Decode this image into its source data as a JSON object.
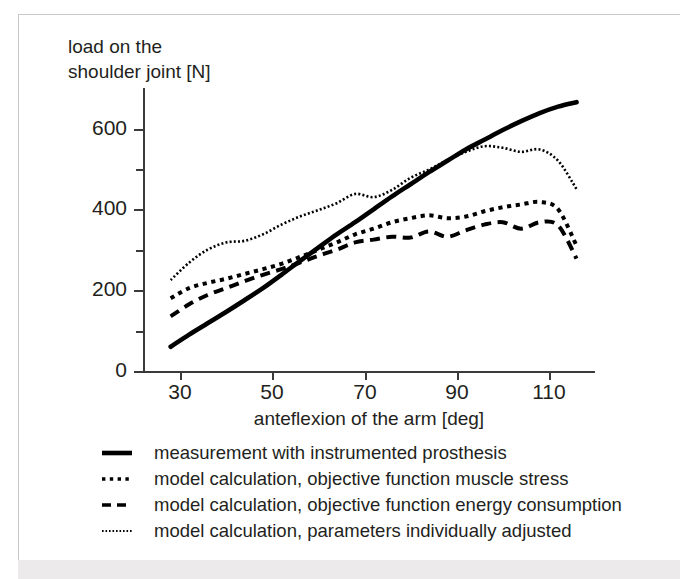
{
  "figure": {
    "y_axis_title": "load on the\nshoulder joint [N]",
    "x_axis_title": "anteflexion of the arm  [deg]"
  },
  "axes": {
    "y_major_ticks": [
      "0",
      "200",
      "400",
      "600"
    ],
    "x_ticks": [
      "30",
      "50",
      "70",
      "90",
      "110"
    ]
  },
  "legend": {
    "items": [
      {
        "label": "measurement with instrumented prosthesis",
        "key": "solid-line-key"
      },
      {
        "label": "model calculation, objective function muscle stress",
        "key": "dotted-line-key"
      },
      {
        "label": "model calculation, objective function energy consumption",
        "key": "dashed-line-key"
      },
      {
        "label": "model calculation, parameters individually adjusted",
        "key": "fine-dotted-line-key"
      }
    ]
  },
  "chart_data": {
    "type": "line",
    "title": "",
    "xlabel": "anteflexion of the arm  [deg]",
    "ylabel": "load on the shoulder joint [N]",
    "xlim": [
      22,
      120
    ],
    "ylim": [
      0,
      700
    ],
    "x_ticks": [
      30,
      50,
      70,
      90,
      110
    ],
    "y_ticks": [
      0,
      200,
      400,
      600
    ],
    "y_minor_ticks": [
      100,
      300,
      500
    ],
    "grid": false,
    "legend_position": "below-axes",
    "series": [
      {
        "name": "measurement with instrumented prosthesis",
        "style": "solid",
        "color": "#000000",
        "x": [
          28,
          32,
          36,
          40,
          44,
          48,
          52,
          56,
          60,
          64,
          68,
          72,
          76,
          80,
          84,
          88,
          92,
          96,
          100,
          104,
          108,
          112,
          116
        ],
        "values": [
          60,
          90,
          118,
          146,
          175,
          205,
          238,
          272,
          305,
          338,
          368,
          400,
          432,
          462,
          492,
          520,
          548,
          572,
          596,
          618,
          638,
          654,
          665
        ]
      },
      {
        "name": "model calculation, objective function muscle stress",
        "style": "dotted",
        "color": "#000000",
        "x": [
          28,
          32,
          36,
          40,
          44,
          48,
          52,
          56,
          60,
          64,
          68,
          72,
          76,
          80,
          84,
          88,
          92,
          96,
          100,
          104,
          108,
          112,
          116
        ],
        "values": [
          180,
          205,
          218,
          228,
          240,
          252,
          265,
          282,
          300,
          318,
          338,
          352,
          368,
          378,
          385,
          378,
          382,
          395,
          405,
          412,
          418,
          400,
          310
        ]
      },
      {
        "name": "model calculation, objective function energy consumption",
        "style": "dashed",
        "color": "#000000",
        "x": [
          28,
          32,
          36,
          40,
          44,
          48,
          52,
          56,
          60,
          64,
          68,
          72,
          76,
          80,
          84,
          88,
          92,
          96,
          100,
          104,
          108,
          112,
          116
        ],
        "values": [
          135,
          165,
          188,
          205,
          222,
          238,
          252,
          268,
          285,
          300,
          318,
          325,
          332,
          330,
          345,
          332,
          348,
          362,
          368,
          352,
          368,
          360,
          278
        ]
      },
      {
        "name": "model calculation, parameters individually adjusted",
        "style": "fine-dotted",
        "color": "#000000",
        "x": [
          28,
          32,
          36,
          40,
          44,
          48,
          52,
          56,
          60,
          64,
          68,
          72,
          76,
          80,
          84,
          88,
          92,
          96,
          100,
          104,
          108,
          112,
          116
        ],
        "values": [
          225,
          268,
          300,
          318,
          322,
          338,
          362,
          382,
          398,
          415,
          438,
          430,
          448,
          478,
          498,
          522,
          542,
          556,
          552,
          542,
          548,
          520,
          450
        ]
      }
    ]
  }
}
